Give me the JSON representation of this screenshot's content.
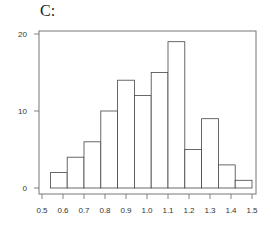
{
  "panel": {
    "label": "C:"
  },
  "chart_data": {
    "type": "bar",
    "subtype": "histogram",
    "title": "C:",
    "xlabel": "",
    "ylabel": "",
    "bin_edges": [
      0.55,
      0.65,
      0.75,
      0.85,
      0.95,
      1.05,
      1.15,
      1.25,
      1.35,
      1.45,
      1.55,
      1.65,
      1.75
    ],
    "bins": [
      {
        "start": 0.54,
        "end": 0.62,
        "count": 2
      },
      {
        "start": 0.62,
        "end": 0.7,
        "count": 4
      },
      {
        "start": 0.7,
        "end": 0.78,
        "count": 6
      },
      {
        "start": 0.78,
        "end": 0.86,
        "count": 10
      },
      {
        "start": 0.86,
        "end": 0.94,
        "count": 14
      },
      {
        "start": 0.94,
        "end": 1.02,
        "count": 12
      },
      {
        "start": 1.02,
        "end": 1.1,
        "count": 15
      },
      {
        "start": 1.1,
        "end": 1.18,
        "count": 19
      },
      {
        "start": 1.18,
        "end": 1.26,
        "count": 5
      },
      {
        "start": 1.26,
        "end": 1.34,
        "count": 9
      },
      {
        "start": 1.34,
        "end": 1.42,
        "count": 3
      },
      {
        "start": 1.42,
        "end": 1.5,
        "count": 1
      }
    ],
    "values": [
      2,
      4,
      6,
      10,
      14,
      12,
      15,
      19,
      5,
      9,
      3,
      1
    ],
    "xticks": [
      "0.5",
      "0.6",
      "0.7",
      "0.8",
      "0.9",
      "1.0",
      "1.1",
      "1.2",
      "1.3",
      "1.4",
      "1.5"
    ],
    "yticks": [
      "0",
      "10",
      "20"
    ],
    "xlim": [
      0.5,
      1.5
    ],
    "ylim": [
      0,
      20
    ],
    "grid": false,
    "legend": null,
    "colors": {
      "bar_fill": "#ffffff",
      "bar_stroke": "#444444",
      "axis": "#666666"
    }
  }
}
